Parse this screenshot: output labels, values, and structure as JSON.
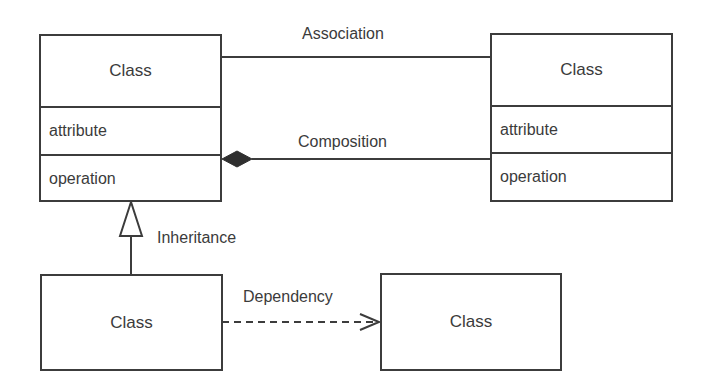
{
  "diagram": {
    "type": "UML class diagram",
    "colors": {
      "line": "#3c3c3c",
      "text": "#3b3b3b",
      "background": "#ffffff"
    },
    "classes": [
      {
        "id": "top-left",
        "name": "Class",
        "attribute": "attribute",
        "operation": "operation"
      },
      {
        "id": "top-right",
        "name": "Class",
        "attribute": "attribute",
        "operation": "operation"
      },
      {
        "id": "bottom-left",
        "name": "Class"
      },
      {
        "id": "bottom-right",
        "name": "Class"
      }
    ],
    "relationships": [
      {
        "type": "association",
        "label": "Association",
        "from": "top-left",
        "to": "top-right"
      },
      {
        "type": "composition",
        "label": "Composition",
        "from": "top-right",
        "to": "top-left"
      },
      {
        "type": "inheritance",
        "label": "Inheritance",
        "from": "bottom-left",
        "to": "top-left"
      },
      {
        "type": "dependency",
        "label": "Dependency",
        "from": "bottom-left",
        "to": "bottom-right"
      }
    ]
  }
}
